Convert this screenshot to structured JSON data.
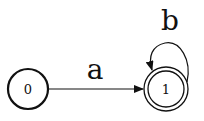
{
  "diagram": {
    "type": "finite-automaton",
    "states": [
      {
        "id": "0",
        "label": "0",
        "accepting": false
      },
      {
        "id": "1",
        "label": "1",
        "accepting": true
      }
    ],
    "transitions": [
      {
        "from": "0",
        "to": "1",
        "label": "a"
      },
      {
        "from": "1",
        "to": "1",
        "label": "b"
      }
    ]
  }
}
